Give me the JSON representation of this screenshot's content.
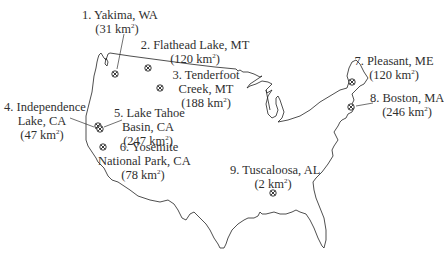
{
  "map": {
    "title": "",
    "region": "Contiguous United States",
    "marker_icon": "circled-x-icon",
    "sites": [
      {
        "id": 1,
        "name_line1": "1. Yakima, WA",
        "name_line2": "",
        "area_value": "31",
        "area_unit": "km",
        "area_exp": "2",
        "area_text": "(31 km²)"
      },
      {
        "id": 2,
        "name_line1": "2. Flathead Lake, MT",
        "name_line2": "",
        "area_value": "120",
        "area_unit": "km",
        "area_exp": "2",
        "area_text": "(120 km²)"
      },
      {
        "id": 3,
        "name_line1": "3. Tenderfoot",
        "name_line2": "Creek, MT",
        "area_value": "188",
        "area_unit": "km",
        "area_exp": "2",
        "area_text": "(188 km²)"
      },
      {
        "id": 4,
        "name_line1": "4. Independence",
        "name_line2": "Lake, CA",
        "area_value": "47",
        "area_unit": "km",
        "area_exp": "2",
        "area_text": "(47 km²)"
      },
      {
        "id": 5,
        "name_line1": "5. Lake Tahoe",
        "name_line2": "Basin, CA",
        "area_value": "247",
        "area_unit": "km",
        "area_exp": "2",
        "area_text": "(247 km²)"
      },
      {
        "id": 6,
        "name_line1": "6. Yosemite",
        "name_line2": "National Park, CA",
        "area_value": "78",
        "area_unit": "km",
        "area_exp": "2",
        "area_text": "(78 km²)"
      },
      {
        "id": 7,
        "name_line1": "7. Pleasant, ME",
        "name_line2": "",
        "area_value": "120",
        "area_unit": "km",
        "area_exp": "2",
        "area_text": "(120 km²)"
      },
      {
        "id": 8,
        "name_line1": "8. Boston, MA",
        "name_line2": "",
        "area_value": "246",
        "area_unit": "km",
        "area_exp": "2",
        "area_text": "(246 km²)"
      },
      {
        "id": 9,
        "name_line1": "9. Tuscaloosa, AL",
        "name_line2": "",
        "area_value": "2",
        "area_unit": "km",
        "area_exp": "2",
        "area_text": "(2 km²)"
      }
    ],
    "colors": {
      "outline": "#222222",
      "text": "#2f2f2f",
      "background": "#ffffff"
    }
  }
}
